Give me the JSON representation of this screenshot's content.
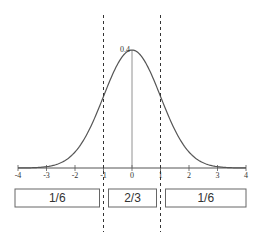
{
  "chart_data": {
    "type": "line",
    "title": "",
    "xlabel": "",
    "ylabel": "",
    "xlim": [
      -4,
      4
    ],
    "ylim": [
      0,
      0.4
    ],
    "x_ticks": [
      -4,
      -3,
      -2,
      -1,
      0,
      1,
      2,
      3,
      4
    ],
    "x_tick_labels": [
      "-4",
      "-3",
      "-2",
      "-1",
      "0",
      "1",
      "2",
      "3",
      "4"
    ],
    "peak_label": "0.4",
    "series": [
      {
        "name": "standard normal density",
        "function": "normal_pdf",
        "mean": 0,
        "sd": 1
      }
    ],
    "dashed_lines_x": [
      -1,
      1
    ],
    "regions": [
      {
        "from": -4,
        "to": -1,
        "label": "1/6"
      },
      {
        "from": -1,
        "to": 1,
        "label": "2/3"
      },
      {
        "from": 1,
        "to": 4,
        "label": "1/6"
      }
    ],
    "colors": {
      "curve": "#555555",
      "axis": "#555555",
      "dashed": "#333333",
      "box": "#666666"
    }
  }
}
